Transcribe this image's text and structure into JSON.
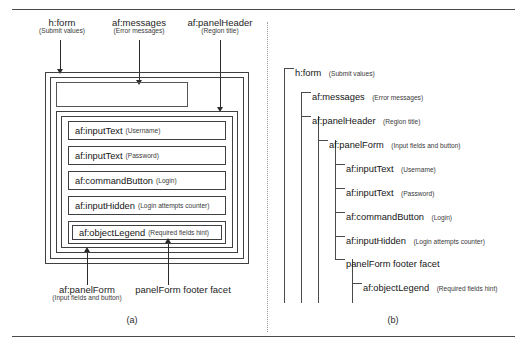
{
  "figure": {
    "panel_a_caption": "(a)",
    "panel_b_caption": "(b)"
  },
  "callouts": [
    {
      "name": "h-form",
      "main": "h:form",
      "sub": "(Submit values)"
    },
    {
      "name": "af-messages",
      "main": "af:messages",
      "sub": "(Error messages)"
    },
    {
      "name": "af-panelheader",
      "main": "af:panelHeader",
      "sub": "(Region title)"
    },
    {
      "name": "af-panelform",
      "main": "af:panelForm",
      "sub": "(Input fields and button)"
    },
    {
      "name": "footer-facet",
      "main": "panelForm footer facet",
      "sub": ""
    }
  ],
  "panel_a": {
    "rows": [
      {
        "name": "af-inputtext-username",
        "tag": "af:inputText",
        "note": "(Username)"
      },
      {
        "name": "af-inputtext-password",
        "tag": "af:inputText",
        "note": "(Password)"
      },
      {
        "name": "af-commandbutton-login",
        "tag": "af:commandButton",
        "note": "(Login)"
      },
      {
        "name": "af-inputhidden",
        "tag": "af:inputHidden",
        "note": "(Login attempts counter)"
      },
      {
        "name": "af-objectlegend",
        "tag": "af:objectLegend",
        "note": "(Required fields hint)"
      }
    ]
  },
  "panel_b": {
    "nodes": [
      {
        "name": "h-form",
        "depth": 0,
        "tag": "h:form",
        "note": "(Submit values)"
      },
      {
        "name": "af-messages",
        "depth": 1,
        "tag": "af:messages",
        "note": "(Error messages)"
      },
      {
        "name": "af-panelheader",
        "depth": 1,
        "tag": "af:panelHeader",
        "note": "(Region title)"
      },
      {
        "name": "af-panelform",
        "depth": 2,
        "tag": "af:panelForm",
        "note": "(Input fields and button)"
      },
      {
        "name": "af-inputtext-username",
        "depth": 3,
        "tag": "af:inputText",
        "note": "(Username)"
      },
      {
        "name": "af-inputtext-password",
        "depth": 3,
        "tag": "af:inputText",
        "note": "(Password)"
      },
      {
        "name": "af-commandbutton-login",
        "depth": 3,
        "tag": "af:commandButton",
        "note": "(Login)"
      },
      {
        "name": "af-inputhidden",
        "depth": 3,
        "tag": "af:inputHidden",
        "note": "(Login attempts counter)"
      },
      {
        "name": "footer-facet",
        "depth": 3,
        "tag": "panelForm footer facet",
        "note": ""
      },
      {
        "name": "af-objectlegend",
        "depth": 4,
        "tag": "af:objectLegend",
        "note": "(Required fields hint)"
      }
    ]
  },
  "colors": {
    "ink": "#1a1a1a",
    "line": "#3f3f3f",
    "rule": "#4a4a4a",
    "divider": "#9a9a9a",
    "background": "#ffffff"
  }
}
